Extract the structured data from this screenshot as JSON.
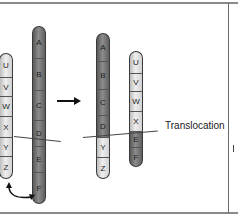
{
  "diagram": {
    "title": "Translocation",
    "label_translocation": "Translocation",
    "before": {
      "chromosome_light": [
        "U",
        "V",
        "W",
        "X",
        "Y",
        "Z"
      ],
      "chromosome_dark": [
        "A",
        "B",
        "C",
        "D",
        "E",
        "F"
      ]
    },
    "after": {
      "chromosome_dark_recombined": [
        "A",
        "B",
        "C",
        "D",
        "Y",
        "Z"
      ],
      "chromosome_light_recombined": [
        "U",
        "V",
        "W",
        "X",
        "E",
        "F"
      ]
    },
    "arrow": "right-arrow",
    "exchange_arrow": "curved-double-arrow",
    "colors": {
      "light_segment": "#e6e6e6",
      "dark_segment": "#7a7a7a",
      "outline": "#3a3a3a",
      "frame": "#8a8a8a"
    }
  }
}
